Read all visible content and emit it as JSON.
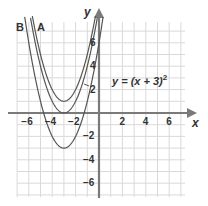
{
  "chart_data": {
    "type": "line",
    "title": "",
    "xlabel": "x",
    "ylabel": "y",
    "xlim": [
      -7,
      7.3
    ],
    "ylim": [
      -7,
      7
    ],
    "grid": true,
    "x_ticks": [
      -6,
      -4,
      -2,
      2,
      4,
      6
    ],
    "y_ticks": [
      6,
      4,
      2,
      -2,
      -4,
      -6
    ],
    "x_tick_labels": [
      "−6",
      "−4",
      "−2",
      "2",
      "4",
      "6"
    ],
    "y_tick_labels": [
      "6",
      "4",
      "2",
      "−2",
      "−4",
      "−6"
    ],
    "series": [
      {
        "name": "A",
        "equation": "y = (x + 3)^2 + 1",
        "h": -3,
        "k": 1,
        "vertex": [
          -3,
          1
        ]
      },
      {
        "name": "y = (x + 3)^2",
        "equation": "y = (x + 3)^2",
        "h": -3,
        "k": 0,
        "vertex": [
          -3,
          0
        ]
      },
      {
        "name": "B",
        "equation": "y = (x + 3)^2 - 3",
        "h": -3,
        "k": -3,
        "vertex": [
          -3,
          -3
        ]
      }
    ],
    "annotations": {
      "curve_label_a": "A",
      "curve_label_b": "B",
      "equation_label_main": "y = (x + 3)",
      "equation_exponent": "2"
    }
  },
  "axes": {
    "x_name": "x",
    "y_name": "y"
  },
  "colors": {
    "axis": "#7a7a7a",
    "grid": "#d9d9d9",
    "curve": "#555555",
    "text": "#333333"
  }
}
